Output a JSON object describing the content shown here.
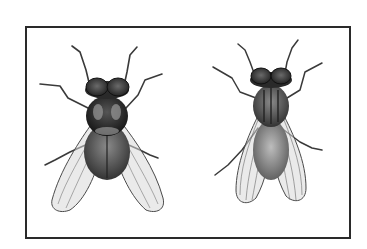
{
  "figure": {
    "alt": "Illustration of two flies viewed from above inside a rectangular frame",
    "frame_color": "#2a2a2a",
    "background": "#ffffff",
    "subjects": [
      {
        "name": "left-fly",
        "description": "Housefly-like fly, dark thorax, translucent wings spread"
      },
      {
        "name": "right-fly",
        "description": "Stable-fly-like fly, striped thorax, translucent veined wings"
      }
    ]
  }
}
